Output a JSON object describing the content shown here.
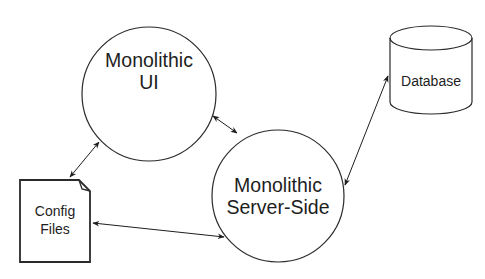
{
  "diagram": {
    "nodes": {
      "ui": {
        "line1": "Monolithic",
        "line2": "UI",
        "shape": "circle"
      },
      "server": {
        "line1": "Monolithic",
        "line2": "Server-Side",
        "shape": "circle"
      },
      "database": {
        "label": "Database",
        "shape": "cylinder"
      },
      "config": {
        "line1": "Config",
        "line2": "Files",
        "shape": "document"
      }
    },
    "edges": [
      {
        "from": "Monolithic UI",
        "to": "Monolithic Server-Side",
        "direction": "bidirectional"
      },
      {
        "from": "Monolithic UI",
        "to": "Config Files",
        "direction": "bidirectional"
      },
      {
        "from": "Monolithic Server-Side",
        "to": "Database",
        "direction": "bidirectional"
      },
      {
        "from": "Monolithic Server-Side",
        "to": "Config Files",
        "direction": "bidirectional"
      }
    ],
    "colors": {
      "stroke": "#2a2a2a",
      "text": "#1e1e1e",
      "background": "#ffffff"
    }
  }
}
